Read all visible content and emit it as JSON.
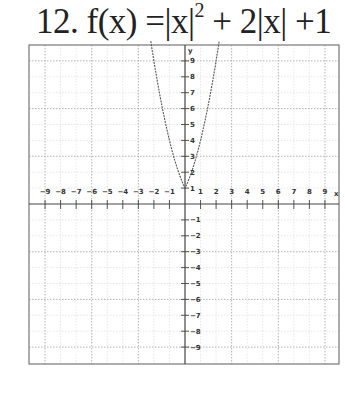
{
  "problem": {
    "number": "12.",
    "lhs": "f(x) =",
    "abs1": "|x|",
    "exp": "2",
    "rest": "+ 2|x| +1"
  },
  "chart_data": {
    "type": "line",
    "xlabel": "x",
    "ylabel": "y",
    "xlim": [
      -9.9,
      10
    ],
    "ylim": [
      -10,
      10
    ],
    "grid": true,
    "x_ticks": [
      -9,
      -8,
      -7,
      -6,
      -5,
      -4,
      -3,
      -2,
      -1,
      1,
      2,
      3,
      4,
      5,
      6,
      7,
      8,
      9
    ],
    "y_ticks": [
      -9,
      -8,
      -7,
      -6,
      -5,
      -4,
      -3,
      -2,
      -1,
      1,
      2,
      3,
      4,
      5,
      6,
      7,
      8,
      9
    ],
    "series": [
      {
        "name": "f(x) = |x|^2 + 2|x| + 1",
        "x": [
          -2.16,
          -2,
          -1.5,
          -1,
          -0.5,
          0,
          0.5,
          1,
          1.5,
          2,
          2.16
        ],
        "y": [
          10,
          9,
          6.25,
          4,
          2.25,
          1,
          2.25,
          4,
          6.25,
          9,
          10
        ]
      }
    ],
    "colors": {
      "curve": "#555555",
      "grid": "#c8c8c8",
      "axis": "#444444"
    }
  }
}
